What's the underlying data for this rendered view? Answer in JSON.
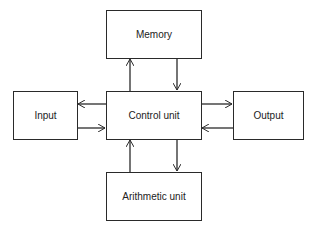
{
  "diagram": {
    "nodes": {
      "memory": "Memory",
      "control": "Control unit",
      "input": "Input",
      "output": "Output",
      "arithmetic": "Arithmetic unit"
    },
    "edges": [
      {
        "from": "control",
        "to": "memory"
      },
      {
        "from": "memory",
        "to": "control"
      },
      {
        "from": "control",
        "to": "input"
      },
      {
        "from": "input",
        "to": "control"
      },
      {
        "from": "control",
        "to": "output"
      },
      {
        "from": "output",
        "to": "control"
      },
      {
        "from": "arithmetic",
        "to": "control"
      },
      {
        "from": "control",
        "to": "arithmetic"
      }
    ]
  }
}
